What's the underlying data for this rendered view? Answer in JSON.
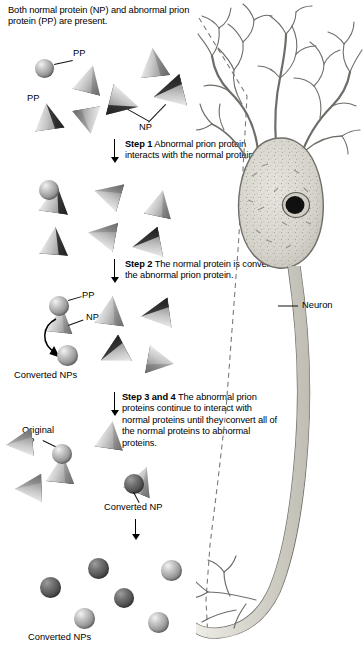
{
  "figure": {
    "intro": "Both normal protein (NP) and abnormal prion protein (PP) are present."
  },
  "steps": [
    {
      "id": "step-1",
      "bold": "Step 1",
      "text": " Abnormal prion protein interacts with the normal protein.",
      "lines": [
        "Step 1 Abnormal prion",
        "protein interacts with the",
        "normal protein."
      ]
    },
    {
      "id": "step-2",
      "bold": "Step 2",
      "text": " The normal protein is converted to the abnormal prion protein.",
      "lines": [
        "Step 2 The normal protein is converted",
        "to the abnormal prion protein."
      ]
    },
    {
      "id": "step-3-4",
      "bold": "Step 3 and 4",
      "text": " The abnormal prion proteins continue to interact with normal proteins until they convert all of the normal proteins to abnormal proteins.",
      "lines": [
        "Step 3 and 4 The abnormal prion",
        "proteins continue to interact with",
        "normal proteins",
        "until they convert",
        "all of the normal",
        "proteins to abnormal",
        "proteins."
      ]
    }
  ],
  "labels": {
    "pp_1": "PP",
    "pp_2": "PP",
    "np_1": "NP",
    "pp_3": "PP",
    "np_2": "NP",
    "converted_nps_mid": "Converted NPs",
    "original_pp": "Original\nPP",
    "original_pp_line1": "Original",
    "original_pp_line2": "PP",
    "converted_np": "Converted NP",
    "converted_nps_bottom": "Converted NPs",
    "neuron": "Neuron"
  },
  "legend": {
    "np_meaning": "normal protein",
    "pp_meaning": "abnormal prion protein"
  },
  "colors": {
    "background": "#ffffff",
    "text": "#000000",
    "cone_light": "#e0e0e0",
    "cone_shade": "#2b2b2b",
    "sphere_light": "#bdbdbd",
    "sphere_dark": "#4f4f4f",
    "neuron_outline": "#6b6b6b",
    "neuron_fill": "#d8d6cf",
    "nucleus": "#111111"
  },
  "panels": [
    {
      "name": "panel-initial",
      "caption": "Both normal protein (NP) and abnormal prion protein (PP) are present.",
      "spheres": 1,
      "cones": 5
    },
    {
      "name": "panel-step1",
      "caption": "Abnormal prion protein interacts with the normal protein.",
      "spheres": 1,
      "cones": 5
    },
    {
      "name": "panel-step2",
      "caption": "The normal protein is converted to the abnormal prion protein.",
      "spheres": 2,
      "cones": 4
    },
    {
      "name": "panel-step34",
      "caption": "The abnormal prion proteins continue to interact with normal proteins.",
      "spheres": 2,
      "cones": 4
    },
    {
      "name": "panel-final",
      "caption": "Converted NPs",
      "spheres": 6,
      "cones": 0
    }
  ],
  "neuron_parts": {
    "dendrites": "dendrites",
    "soma": "cell body",
    "nucleus": "nucleus",
    "axon": "axon",
    "terminals": "axon terminals"
  }
}
